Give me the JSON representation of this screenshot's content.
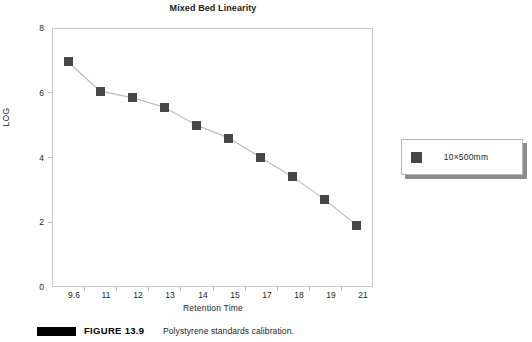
{
  "chart_data": {
    "type": "line",
    "title": "Mixed Bed Linearity",
    "xlabel": "Retention Time",
    "ylabel": "LOG",
    "categories": [
      "9.6",
      "11",
      "12",
      "13",
      "14",
      "15",
      "17",
      "18",
      "19",
      "21"
    ],
    "values": [
      6.95,
      6.05,
      5.85,
      5.55,
      5.0,
      4.6,
      4.0,
      3.4,
      2.7,
      1.9
    ],
    "series": [
      {
        "name": "10×500mm",
        "values": [
          6.95,
          6.05,
          5.85,
          5.55,
          5.0,
          4.6,
          4.0,
          3.4,
          2.7,
          1.9
        ]
      }
    ],
    "ylim": [
      0,
      8
    ],
    "yticks": [
      "0",
      "2",
      "4",
      "6",
      "8"
    ],
    "grid": false,
    "legend_position": "right",
    "marker": "square",
    "marker_color": "#474747",
    "line_color": "#b9babc"
  },
  "legend": {
    "entries": [
      {
        "label": "10×500mm",
        "color": "#474747"
      }
    ]
  },
  "caption": {
    "figure_label": "FIGURE 13.9",
    "text": "Polystyrene standards calibration."
  }
}
